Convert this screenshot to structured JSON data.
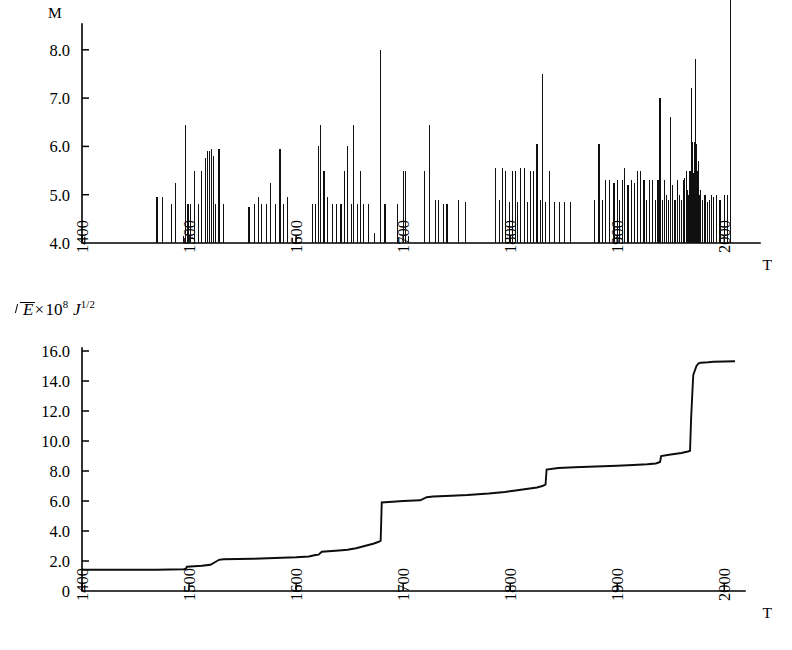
{
  "figure": {
    "panels": [
      {
        "id": "magnitude-panel",
        "y_axis_label": "M",
        "x_axis_label": "T",
        "y_ticks": [
          "4.0",
          "5.0",
          "6.0",
          "7.0",
          "8.0"
        ],
        "x_ticks": [
          "1400",
          "1500",
          "1600",
          "1700",
          "1800",
          "1900",
          "2000"
        ]
      },
      {
        "id": "energy-panel",
        "y_axis_label_parts": {
          "radical_body": "E",
          "times": "×",
          "base": "10",
          "exponent": "8",
          "unit": "J",
          "unit_exponent": "1/2"
        },
        "x_axis_label": "T",
        "y_ticks": [
          "0",
          "2.0",
          "4.0",
          "6.0",
          "8.0",
          "10.0",
          "12.0",
          "14.0",
          "16.0"
        ],
        "x_ticks": [
          "1400",
          "1500",
          "1600",
          "1700",
          "1800",
          "1900",
          "2000"
        ]
      }
    ],
    "colors": {
      "ink": "#000000",
      "background": "#ffffff",
      "bar_fill": "#101010",
      "curve": "#0d0d0d"
    }
  },
  "chart_data": [
    {
      "type": "bar",
      "id": "magnitude-vs-time",
      "title": "",
      "xlabel": "T",
      "ylabel": "M",
      "xlim": [
        1400,
        2020
      ],
      "ylim": [
        4.0,
        8.4
      ],
      "ytick_values": [
        4.0,
        5.0,
        6.0,
        7.0,
        8.0
      ],
      "xtick_values": [
        1400,
        1500,
        1600,
        1700,
        1800,
        1900,
        2000
      ],
      "grid": false,
      "legend": null,
      "baseline": 4.0,
      "x": [
        1470,
        1475,
        1484,
        1487,
        1495,
        1497,
        1499,
        1501,
        1505,
        1509,
        1512,
        1515,
        1517,
        1519,
        1521,
        1523,
        1525,
        1528,
        1532,
        1556,
        1561,
        1565,
        1568,
        1572,
        1576,
        1581,
        1585,
        1588,
        1592,
        1597,
        1615,
        1618,
        1621,
        1623,
        1626,
        1629,
        1634,
        1638,
        1642,
        1645,
        1648,
        1652,
        1654,
        1657,
        1660,
        1663,
        1668,
        1673,
        1679,
        1683,
        1695,
        1700,
        1702,
        1705,
        1720,
        1725,
        1730,
        1733,
        1738,
        1741,
        1752,
        1758,
        1786,
        1790,
        1793,
        1796,
        1799,
        1802,
        1805,
        1807,
        1810,
        1813,
        1816,
        1819,
        1822,
        1825,
        1828,
        1830,
        1833,
        1837,
        1841,
        1846,
        1851,
        1856,
        1879,
        1883,
        1886,
        1889,
        1893,
        1897,
        1900,
        1902,
        1905,
        1907,
        1910,
        1913,
        1916,
        1919,
        1922,
        1925,
        1927,
        1930,
        1933,
        1936,
        1938,
        1940,
        1942,
        1944,
        1946,
        1948,
        1950,
        1952,
        1954,
        1956,
        1958,
        1960,
        1962,
        1963,
        1965,
        1966,
        1967,
        1968,
        1969,
        1970,
        1971,
        1972,
        1973,
        1974,
        1975,
        1976,
        1977,
        1978,
        1980,
        1982,
        1984,
        1986,
        1988,
        1990,
        1993,
        1996,
        2000,
        2003,
        2006
      ],
      "values": [
        4.95,
        4.95,
        4.8,
        5.25,
        4.15,
        6.45,
        4.8,
        4.8,
        5.5,
        4.8,
        5.5,
        5.75,
        5.9,
        5.9,
        5.95,
        5.8,
        4.8,
        5.95,
        4.8,
        4.75,
        4.8,
        4.95,
        4.8,
        4.8,
        5.25,
        4.8,
        5.95,
        4.8,
        4.95,
        4.1,
        4.8,
        4.8,
        6.0,
        6.45,
        5.5,
        4.95,
        4.8,
        4.8,
        4.8,
        5.5,
        6.0,
        4.8,
        6.45,
        4.8,
        5.5,
        4.8,
        4.8,
        4.2,
        8.0,
        4.8,
        4.8,
        5.5,
        5.5,
        4.15,
        5.5,
        6.45,
        4.9,
        4.9,
        4.8,
        4.8,
        4.9,
        4.85,
        5.55,
        4.9,
        5.55,
        5.5,
        4.85,
        5.5,
        5.5,
        4.85,
        5.55,
        5.55,
        4.85,
        5.5,
        5.5,
        6.05,
        4.9,
        7.5,
        4.85,
        5.5,
        4.85,
        4.85,
        4.85,
        4.85,
        4.9,
        6.05,
        4.9,
        5.3,
        5.3,
        5.25,
        5.3,
        4.9,
        5.3,
        5.55,
        5.2,
        5.3,
        5.25,
        5.5,
        5.5,
        5.3,
        4.9,
        5.3,
        5.3,
        4.9,
        5.3,
        7.0,
        4.9,
        5.3,
        5.0,
        4.9,
        6.6,
        5.2,
        4.9,
        5.3,
        5.0,
        4.9,
        5.3,
        5.35,
        5.5,
        5.1,
        5.0,
        5.5,
        7.2,
        6.1,
        5.45,
        6.1,
        7.8,
        6.05,
        5.5,
        5.7,
        5.0,
        5.1,
        4.9,
        5.0,
        4.85,
        4.9,
        5.0,
        4.95,
        5.0,
        4.9,
        5.0,
        5.0
      ]
    },
    {
      "type": "line",
      "id": "cumulative-sqrt-energy-vs-time",
      "title": "",
      "xlabel": "T",
      "ylabel": "sqrt(E) x 10^8 J^1/2",
      "xlim": [
        1400,
        2020
      ],
      "ylim": [
        0,
        16.5
      ],
      "ytick_values": [
        0,
        2.0,
        4.0,
        6.0,
        8.0,
        10.0,
        12.0,
        14.0,
        16.0
      ],
      "xtick_values": [
        1400,
        1500,
        1600,
        1700,
        1800,
        1900,
        2000
      ],
      "grid": false,
      "legend": null,
      "step_like": true,
      "x": [
        1400,
        1470,
        1495,
        1497,
        1498,
        1512,
        1520,
        1528,
        1532,
        1560,
        1580,
        1600,
        1612,
        1618,
        1621,
        1624,
        1640,
        1648,
        1652,
        1656,
        1664,
        1672,
        1676,
        1678,
        1679,
        1680,
        1690,
        1700,
        1716,
        1722,
        1728,
        1745,
        1760,
        1780,
        1795,
        1805,
        1815,
        1825,
        1830,
        1832,
        1833,
        1834,
        1845,
        1860,
        1880,
        1900,
        1915,
        1928,
        1936,
        1938,
        1940,
        1941,
        1950,
        1955,
        1960,
        1963,
        1966,
        1968,
        1969,
        1970,
        1971,
        1974,
        1975,
        1976,
        1978,
        1985,
        1990,
        2000,
        2010
      ],
      "values": [
        1.42,
        1.42,
        1.45,
        1.48,
        1.62,
        1.68,
        1.75,
        2.08,
        2.12,
        2.15,
        2.2,
        2.25,
        2.3,
        2.4,
        2.42,
        2.62,
        2.7,
        2.75,
        2.8,
        2.85,
        3.0,
        3.15,
        3.25,
        3.3,
        3.35,
        5.9,
        5.95,
        6.0,
        6.05,
        6.25,
        6.3,
        6.35,
        6.4,
        6.5,
        6.6,
        6.7,
        6.8,
        6.9,
        7.0,
        7.05,
        7.1,
        8.1,
        8.2,
        8.25,
        8.3,
        8.35,
        8.4,
        8.45,
        8.5,
        8.55,
        8.6,
        9.0,
        9.1,
        9.15,
        9.2,
        9.25,
        9.3,
        9.35,
        11.5,
        13.0,
        14.4,
        15.0,
        15.1,
        15.18,
        15.22,
        15.25,
        15.28,
        15.3,
        15.32
      ]
    }
  ]
}
